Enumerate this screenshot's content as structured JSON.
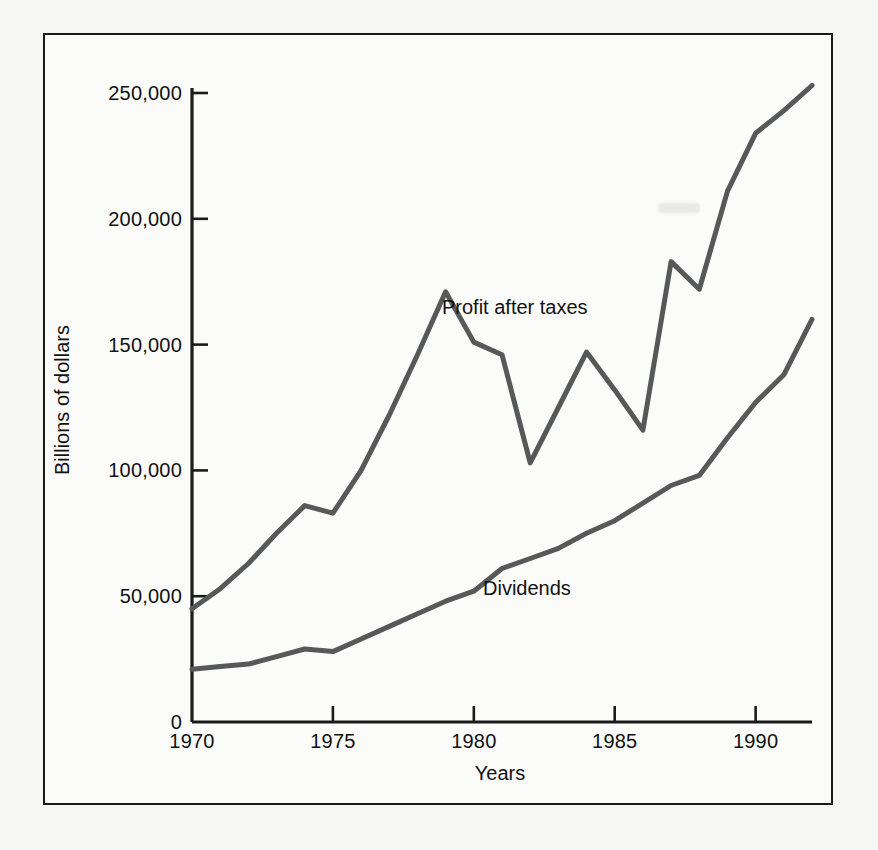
{
  "figure": {
    "axis_color": "#1a1a1a",
    "line_color": "#57585a",
    "background_color": "#fbfbfa",
    "page_color": "#f6f6f4"
  },
  "axes": {
    "y_title": "Billions of dollars",
    "x_title": "Years",
    "y_ticks": [
      "0",
      "50,000",
      "100,000",
      "150,000",
      "200,000",
      "250,000"
    ],
    "x_ticks": [
      "1970",
      "1975",
      "1980",
      "1985",
      "1990"
    ]
  },
  "labels": {
    "profit": "Profit after taxes",
    "dividends": "Dividends"
  },
  "chart_data": {
    "type": "line",
    "title": "",
    "xlabel": "Years",
    "ylabel": "Billions of dollars",
    "xlim": [
      1970,
      1992
    ],
    "ylim": [
      0,
      255000
    ],
    "y_ticks": [
      0,
      50000,
      100000,
      150000,
      200000,
      250000
    ],
    "y_tick_labels": [
      "0",
      "50,000",
      "100,000",
      "150,000",
      "200,000",
      "250,000"
    ],
    "x_ticks": [
      1970,
      1975,
      1980,
      1985,
      1990
    ],
    "x_tick_labels": [
      "1970",
      "1975",
      "1980",
      "1985",
      "1990"
    ],
    "grid": false,
    "legend": "inline-annotations",
    "x": [
      1970,
      1971,
      1972,
      1973,
      1974,
      1975,
      1976,
      1977,
      1978,
      1979,
      1980,
      1981,
      1982,
      1983,
      1984,
      1985,
      1986,
      1987,
      1988,
      1989,
      1990,
      1991,
      1992
    ],
    "series": [
      {
        "name": "Profit after taxes",
        "values": [
          45000,
          53000,
          63000,
          75000,
          86000,
          83000,
          100000,
          122000,
          146000,
          171000,
          151000,
          146000,
          103000,
          125000,
          147000,
          132000,
          116000,
          183000,
          172000,
          211000,
          234000,
          243000,
          253000
        ]
      },
      {
        "name": "Dividends",
        "values": [
          21000,
          22000,
          23000,
          26000,
          29000,
          28000,
          33000,
          38000,
          43000,
          48000,
          52000,
          61000,
          65000,
          69000,
          75000,
          80000,
          87000,
          94000,
          98000,
          113000,
          127000,
          138000,
          160000
        ]
      }
    ],
    "annotations": [
      {
        "text": "Profit after taxes",
        "x": 1983.5,
        "y": 163000
      },
      {
        "text": "Dividends",
        "x": 1984.8,
        "y": 52000
      }
    ]
  }
}
